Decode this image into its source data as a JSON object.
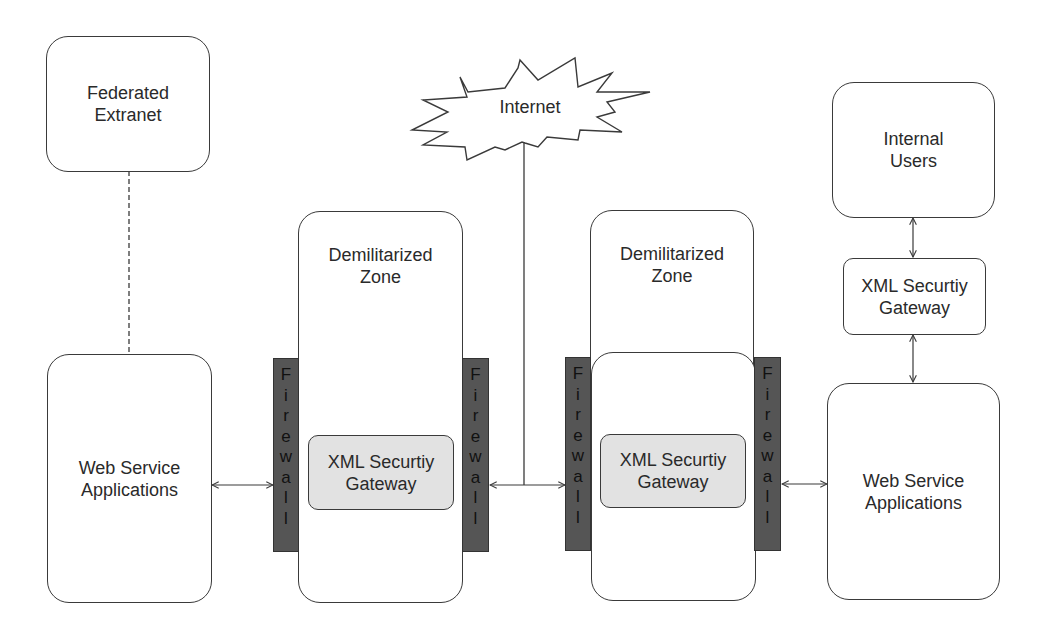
{
  "nodes": {
    "federated_extranet": {
      "label": "Federated\nExtranet"
    },
    "internet": {
      "label": "Internet"
    },
    "dmz_left": {
      "label": "Demilitarized\nZone"
    },
    "dmz_right": {
      "label": "Demilitarized\nZone"
    },
    "internal_users": {
      "label": "Internal\nUsers"
    },
    "web_service_left": {
      "label": "Web Service\nApplications"
    },
    "web_service_right": {
      "label": "Web Service\nApplications"
    },
    "gateway_dmz_left": {
      "label": "XML Securtiy\nGateway"
    },
    "gateway_dmz_right": {
      "label": "XML Securtiy\nGateway"
    },
    "gateway_internal": {
      "label": "XML Securtiy\nGateway"
    }
  },
  "firewalls": [
    {
      "id": "fw1",
      "letters": [
        "F",
        "i",
        "r",
        "e",
        "w",
        "a",
        "l",
        "l"
      ]
    },
    {
      "id": "fw2",
      "letters": [
        "F",
        "i",
        "r",
        "e",
        "w",
        "a",
        "l",
        "l"
      ]
    },
    {
      "id": "fw3",
      "letters": [
        "F",
        "i",
        "r",
        "e",
        "w",
        "a",
        "l",
        "l"
      ]
    },
    {
      "id": "fw4",
      "letters": [
        "F",
        "i",
        "r",
        "e",
        "w",
        "a",
        "l",
        "l"
      ]
    }
  ],
  "colors": {
    "firewall_fill": "#555555",
    "gateway_fill": "#e2e2e2",
    "stroke": "#3a3a3a"
  }
}
